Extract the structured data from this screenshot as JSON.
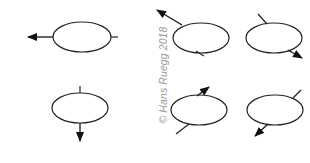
{
  "diagram": {
    "stroke_color": "#222222",
    "arrow_color": "#111111",
    "background": "#ffffff",
    "watermark": "© Hans Ruegg 2018",
    "watermark_color": "#9a9a9a",
    "items": [
      {
        "id": "top-left",
        "center": [
          82,
          37
        ],
        "rx": 29,
        "ry": 15,
        "line": [
          111,
          37,
          118,
          37
        ],
        "arrow": [
          53,
          37,
          28,
          37
        ]
      },
      {
        "id": "top-middle",
        "center": [
          201,
          38
        ],
        "rx": 28,
        "ry": 15,
        "line": [
          196,
          51,
          204,
          56
        ],
        "arrow": [
          182,
          25,
          157,
          10
        ]
      },
      {
        "id": "top-right",
        "center": [
          274,
          38
        ],
        "rx": 28,
        "ry": 15,
        "line": [
          267,
          24,
          258,
          14
        ],
        "arrow": [
          288,
          50,
          302,
          58
        ]
      },
      {
        "id": "bottom-left",
        "center": [
          80,
          108
        ],
        "rx": 28,
        "ry": 15,
        "line": [
          80,
          93,
          80,
          86
        ],
        "arrow": [
          80,
          123,
          80,
          141
        ]
      },
      {
        "id": "bottom-middle",
        "center": [
          199,
          110
        ],
        "rx": 28,
        "ry": 15,
        "line": [
          189,
          124,
          176,
          134
        ],
        "arrow": [
          197,
          96,
          209,
          87
        ]
      },
      {
        "id": "bottom-right",
        "center": [
          275,
          110
        ],
        "rx": 28,
        "ry": 15,
        "line": [
          293,
          98,
          301,
          90
        ],
        "arrow": [
          268,
          124,
          255,
          136
        ]
      }
    ]
  }
}
